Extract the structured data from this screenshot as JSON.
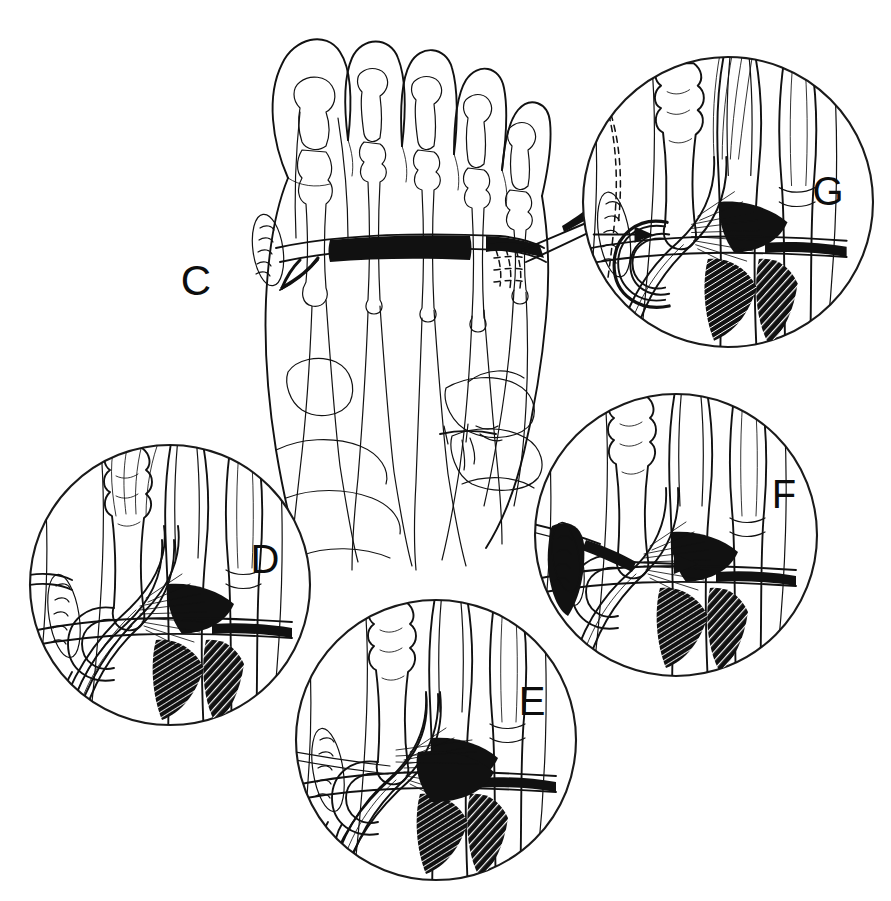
{
  "figure": {
    "kind": "surgical-line-illustration",
    "background_color": "#ffffff",
    "ink_color": "#111111",
    "width": 891,
    "height": 901
  },
  "panels": [
    {
      "id": "C",
      "label": "C",
      "shape": "open",
      "label_x": 196,
      "label_y": 295,
      "center_x": 360,
      "center_y": 270,
      "caption": "Dorsal view of whole foot showing metatarsals, phalanges, long extensor tendons, a transverse tendon sling across the metatarsal heads, an incision at the first metatarsophalangeal joint and a suture needle entering at the fifth toe"
    },
    {
      "id": "G",
      "label": "G",
      "shape": "circle",
      "label_x": 828,
      "label_y": 205,
      "center_x": 728,
      "center_y": 202,
      "radius": 146,
      "caption": "Magnified view: completed tendon loop secured around the proximal phalanx with dashed outline of the prior tendon position and a directional arrow"
    },
    {
      "id": "F",
      "label": "F",
      "shape": "circle",
      "label_x": 784,
      "label_y": 508,
      "center_x": 676,
      "center_y": 535,
      "radius": 142,
      "caption": "Magnified view: suture needle passed beneath the tendon sling with arrow indicating the direction of tendon transfer"
    },
    {
      "id": "D",
      "label": "D",
      "shape": "circle",
      "label_x": 265,
      "label_y": 573,
      "center_x": 170,
      "center_y": 585,
      "radius": 141,
      "caption": "Magnified view: tendon released and drawn across the metatarsal, crossing beneath the transverse band"
    },
    {
      "id": "E",
      "label": "E",
      "shape": "circle",
      "label_x": 532,
      "label_y": 715,
      "center_x": 436,
      "center_y": 740,
      "radius": 141,
      "caption": "Magnified view: tendon routed under the intermetatarsal band and held with a suture strand passing across the field"
    }
  ],
  "features": {
    "incision_oval": "first metatarsophalangeal joint incision with suture marks",
    "needle": "curved surgical needle with suture thread entering at the fifth toe",
    "transverse_band": "transverse tendon band across the metatarsal heads",
    "arrow": "directional transfer arrow",
    "dashed_outline": "dashed original tendon position"
  }
}
